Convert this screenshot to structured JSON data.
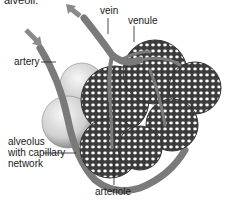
{
  "caption": "alveoli.",
  "labels": {
    "vein": "vein",
    "venule": "venule",
    "artery": "artery",
    "alveolus_line1": "alveolus",
    "alveolus_line2": "with capillary",
    "alveolus_line3": "network",
    "arteriole": "arteriole"
  },
  "colors": {
    "vessel": "#7a7a7a",
    "vessel_dark": "#4a4a4a",
    "mesh": "#3c3c3c",
    "alveolus_light": "#e8e8e8",
    "arrow": "#8a8a8a",
    "text": "#1a1a1a"
  },
  "arrows": [
    {
      "name": "inflow-arrow",
      "direction": "down-right"
    },
    {
      "name": "outflow-arrow",
      "direction": "up-left"
    }
  ]
}
